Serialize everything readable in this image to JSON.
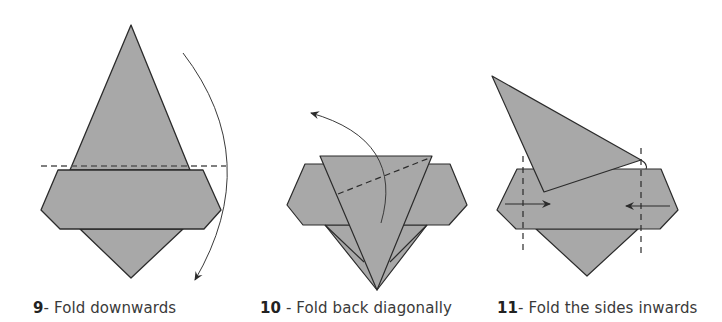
{
  "colors": {
    "paper_fill": "#a8a8a8",
    "outline": "#2b2b2b",
    "background": "#ffffff",
    "caption_text": "#3a3a3a"
  },
  "steps": [
    {
      "number": "9",
      "separator": "- ",
      "label": "Fold downwards",
      "arrow": "curved-arrow-down",
      "fold_line": "horizontal-dashed"
    },
    {
      "number": "10",
      "separator": " - ",
      "label": "Fold back diagonally",
      "arrow": "curved-arrow-up-left",
      "fold_line": "diagonal-dashed"
    },
    {
      "number": "11",
      "separator": "- ",
      "label": "Fold the sides inwards",
      "arrow": "straight-arrows-inward",
      "fold_line": "vertical-dashed-pair"
    }
  ]
}
